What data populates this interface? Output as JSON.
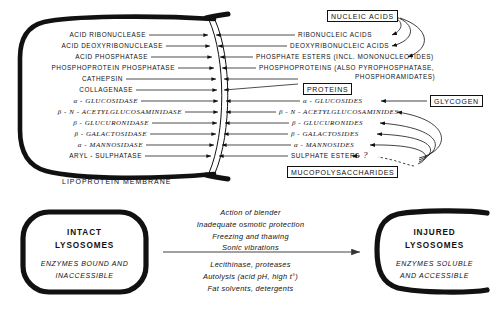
{
  "diagram": {
    "title_alt": "Lysosome enzymes and substrates diagram",
    "membrane_label": "LIPOPROTEIN MEMBRANE",
    "question_mark": "?"
  },
  "enzymes": [
    {
      "label": "ACID RIBONUCLEASE",
      "y": 35
    },
    {
      "label": "ACID DEOXYRIBONUCLEASE",
      "y": 46
    },
    {
      "label": "ACID PHOSPHATASE",
      "y": 57
    },
    {
      "label": "PHOSPHOPROTEIN PHOSPHATASE",
      "y": 68
    },
    {
      "label": "CATHEPSIN",
      "y": 79
    },
    {
      "label": "COLLAGENASE",
      "y": 90
    },
    {
      "label": "α - GLUCOSIDASE",
      "y": 101
    },
    {
      "label": "β - N - ACETYLGLUCOSAMINIDASE",
      "y": 112
    },
    {
      "label": "β - GLUCURONIDASE",
      "y": 123
    },
    {
      "label": "β - GALACTOSIDASE",
      "y": 134
    },
    {
      "label": "α - MANNOSIDASE",
      "y": 145
    },
    {
      "label": "ARYL - SULPHATASE",
      "y": 156
    }
  ],
  "substrates": [
    {
      "label": "RIBONUCLEIC ACIDS",
      "y": 35
    },
    {
      "label": "DEOXYRIBONUCLEIC ACIDS",
      "y": 46
    },
    {
      "label": "PHOSPHATE ESTERS (INCL. MONONUCLEOTIDES)",
      "y": 57
    },
    {
      "label": "PHOSPHOPROTEINS (ALSO PYROPHOSPHATASE,",
      "y": 68
    },
    {
      "label": "PHOSPHORAMIDATES)",
      "y": 77
    },
    {
      "label": "α - GLUCOSIDES",
      "y": 101
    },
    {
      "label": "β - N - ACETYLGLUCOSAMINIDES",
      "y": 112
    },
    {
      "label": "β - GLUCURONIDES",
      "y": 123
    },
    {
      "label": "β - GALACTOSIDES",
      "y": 134
    },
    {
      "label": "α - MANNOSIDES",
      "y": 145
    },
    {
      "label": "SULPHATE ESTERS",
      "y": 156
    }
  ],
  "class_boxes": [
    {
      "name": "nucleic-acids",
      "label": "NUCLEIC ACIDS"
    },
    {
      "name": "proteins",
      "label": "PROTEINS"
    },
    {
      "name": "glycogen",
      "label": "GLYCOGEN"
    },
    {
      "name": "mucopolysaccharides",
      "label": "MUCOPOLYSACCHARIDES"
    }
  ],
  "bottom": {
    "intact": {
      "title_line1": "INTACT",
      "title_line2": "LYSOSOMES",
      "sub_line1": "ENZYMES BOUND AND",
      "sub_line2": "INACCESSIBLE"
    },
    "injured": {
      "title_line1": "INJURED",
      "title_line2": "LYSOSOMES",
      "sub_line1": "ENZYMES SOLUBLE",
      "sub_line2": "AND ACCESSIBLE"
    },
    "causes_above": [
      "Action of blender",
      "Inadequate osmotic protection",
      "Freezing and thawing",
      "Sonic vibrations"
    ],
    "causes_below": [
      "Lecithinase, proteases",
      "Autolysis (acid pH, high t°)",
      "Fat solvents, detergents"
    ]
  },
  "colors": {
    "ink": "#111111",
    "background": "#ffffff"
  }
}
